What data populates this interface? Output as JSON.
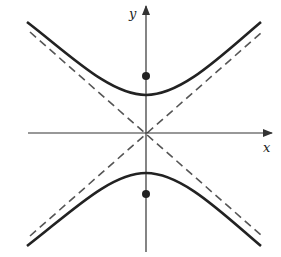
{
  "diagram": {
    "type": "hyperbola",
    "orientation": "vertical",
    "axes": {
      "x_label": "x",
      "y_label": "y"
    },
    "elements": [
      "x-axis",
      "y-axis",
      "upper-branch",
      "lower-branch",
      "asymptote-1",
      "asymptote-2",
      "focus-upper",
      "focus-lower"
    ],
    "colors": {
      "curve": "#222222",
      "asymptote": "#555555",
      "axis": "#333333"
    }
  }
}
